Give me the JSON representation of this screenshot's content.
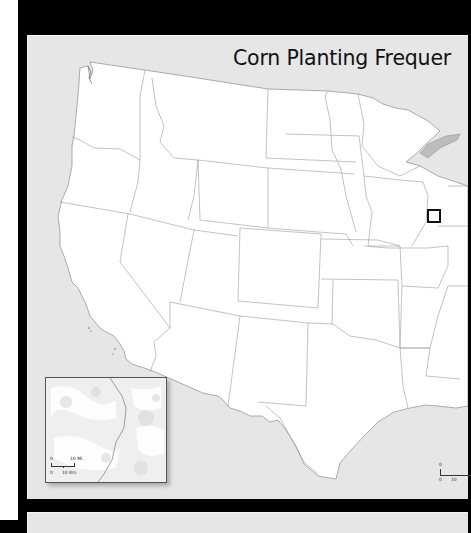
{
  "map": {
    "title": "Corn Planting Frequer",
    "title_full_visible": "Corn Planting Frequen",
    "type": "choropleth-base",
    "region": "Contiguous United States (western/central portion visible)",
    "colors": {
      "background_frame": "#000000",
      "panel": "#e6e6e6",
      "land": "#ffffff",
      "state_border": "#9a9a9a",
      "water": "#c9c9c9",
      "locator_box": "#111111"
    },
    "locator_box_label": "study-area"
  },
  "inset": {
    "scale_top_zero": "0",
    "scale_top_label": "10 Mi.",
    "scale_bottom_zero": "0",
    "scale_bottom_label": "10 Km"
  },
  "main_scale": {
    "top_zero": "0",
    "bottom_zero": "0",
    "bottom_label": "10"
  }
}
